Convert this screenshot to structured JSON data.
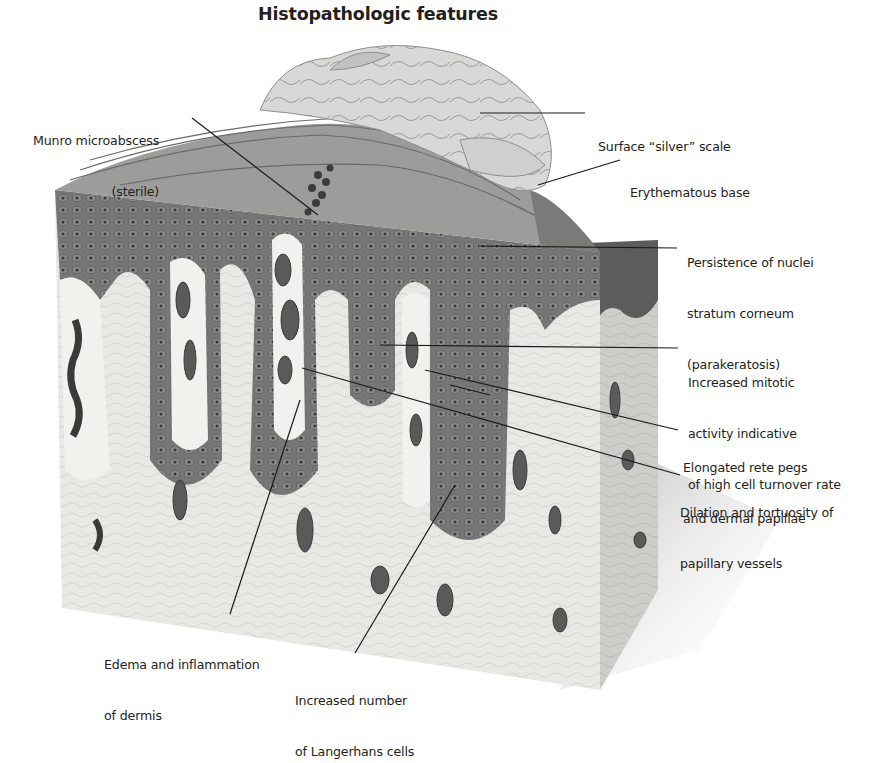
{
  "title": "Histopathologic features",
  "labels": {
    "munro": {
      "line1": "Munro microabscess",
      "line2": "(sterile)"
    },
    "silver_scale": {
      "line1": "Surface “silver” scale"
    },
    "erythematous": {
      "line1": "Erythematous base"
    },
    "parakeratosis": {
      "line1": "Persistence of nuclei",
      "line2": "stratum corneum",
      "line3": "(parakeratosis)"
    },
    "mitotic": {
      "line1": "Increased mitotic",
      "line2": "activity indicative",
      "line3": "of high cell turnover rate"
    },
    "rete_pegs": {
      "line1": "Elongated rete pegs",
      "line2": "and dermal papillae"
    },
    "dilation": {
      "line1": "Dilation and tortuosity of",
      "line2": "papillary vessels"
    },
    "edema": {
      "line1": "Edema and inflammation",
      "line2": "of dermis"
    },
    "langerhans": {
      "line1": "Increased number",
      "line2": "of Langerhans cells"
    }
  },
  "colors": {
    "background": "#ffffff",
    "text": "#231f20",
    "leader_line": "#1a1a1a",
    "epidermis": "#6e6e6e",
    "epidermis_dark": "#4a4a4a",
    "dermis": "#e6e6e2",
    "dermis_side": "#c9c9c6",
    "scale": "#d4d4d2",
    "vessel": "#5a5a5a"
  }
}
